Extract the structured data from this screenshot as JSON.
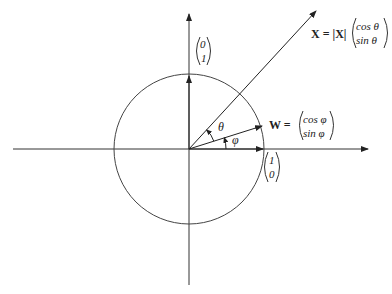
{
  "diagram": {
    "type": "unit-circle-vector-diagram",
    "origin": [
      189,
      149
    ],
    "radius": 75,
    "axes": {
      "horizontal": {
        "from": [
          13,
          149
        ],
        "to": [
          368,
          149
        ]
      },
      "vertical": {
        "from": [
          189,
          285
        ],
        "to": [
          189,
          14
        ]
      }
    },
    "vectors": {
      "x_vector": {
        "tip": [
          316,
          11
        ],
        "label_lhs": "X = |X|",
        "matrix_top": "cos θ",
        "matrix_bottom": "sin θ"
      },
      "w_vector": {
        "tip": [
          262,
          126
        ],
        "label_lhs": "W =",
        "matrix_top": "cos φ",
        "matrix_bottom": "sin φ"
      },
      "e1_vector": {
        "tip": [
          263,
          149
        ],
        "matrix_top": "1",
        "matrix_bottom": "0"
      },
      "e2_vector": {
        "tip": [
          189,
          75
        ],
        "matrix_top": "0",
        "matrix_bottom": "1"
      }
    },
    "angles": {
      "theta_label": "θ",
      "phi_label": "φ"
    }
  }
}
